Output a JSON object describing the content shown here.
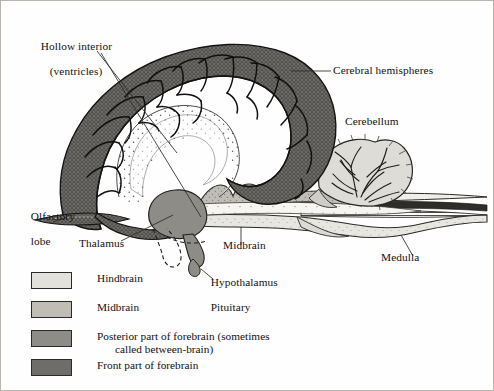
{
  "figure": {
    "type": "anatomical-diagram",
    "background_color": "#fefefe",
    "border_color": "#b9b5ae",
    "ink_color": "#15110f"
  },
  "labels": {
    "hollow_interior_line1": "Hollow interior",
    "hollow_interior_line2": "(ventricles)",
    "cerebral_hemispheres": "Cerebral hemispheres",
    "cerebellum": "Cerebellum",
    "olfactory_line1": "Olfactory",
    "olfactory_line2": "lobe",
    "thalamus": "Thalamus",
    "midbrain": "Midbrain",
    "hypothalamus": "Hypothalamus",
    "pituitary": "Pituitary",
    "medulla": "Medulla"
  },
  "legend": {
    "items": [
      {
        "label": "Hindbrain",
        "label2": "",
        "color": "#e3e1db"
      },
      {
        "label": "Midbrain",
        "label2": "",
        "color": "#c0bdb6"
      },
      {
        "label": "Posterior part of forebrain (sometimes",
        "label2": "called between-brain)",
        "color": "#8e8c87"
      },
      {
        "label": "Front part of forebrain",
        "label2": "",
        "color": "#6f6d69"
      }
    ]
  },
  "regions": {
    "hindbrain_color": "#e3e1db",
    "midbrain_color": "#c0bdb6",
    "between_brain_color": "#8e8c87",
    "forebrain_color": "#6f6d69",
    "ventricle_color": "#ffffff"
  }
}
